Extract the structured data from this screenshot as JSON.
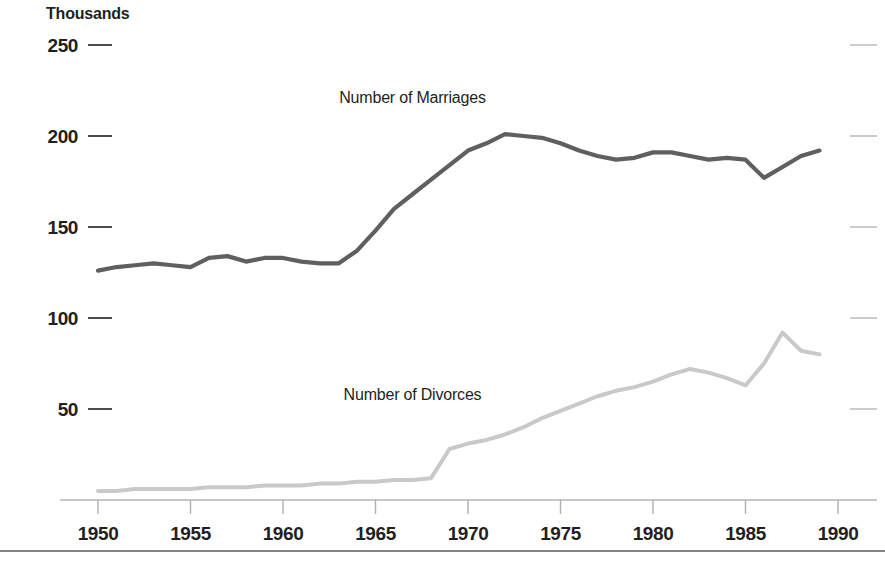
{
  "chart_data": {
    "type": "line",
    "title": "",
    "subtitle": "",
    "unit_label": "Thousands",
    "xlabel": "",
    "ylabel": "",
    "xlim": [
      1950,
      1990
    ],
    "ylim": [
      0,
      250
    ],
    "grid": false,
    "legend_position": "inline-annotation",
    "y_ticks": [
      50,
      100,
      150,
      200,
      250
    ],
    "y_tick_labels": [
      "50",
      "100",
      "150",
      "200",
      "250"
    ],
    "x_ticks": [
      1950,
      1955,
      1960,
      1965,
      1970,
      1975,
      1980,
      1985,
      1990
    ],
    "x_tick_labels": [
      "1950",
      "1955",
      "1960",
      "1965",
      "1970",
      "1975",
      "1980",
      "1985",
      "1990"
    ],
    "x": [
      1950,
      1951,
      1952,
      1953,
      1954,
      1955,
      1956,
      1957,
      1958,
      1959,
      1960,
      1961,
      1962,
      1963,
      1964,
      1965,
      1966,
      1967,
      1968,
      1969,
      1970,
      1971,
      1972,
      1973,
      1974,
      1975,
      1976,
      1977,
      1978,
      1979,
      1980,
      1981,
      1982,
      1983,
      1984,
      1985,
      1986,
      1987,
      1988,
      1989
    ],
    "series": [
      {
        "name": "Number of Marriages",
        "color": "#5f5f5f",
        "label_x": 1967,
        "label_y": 218,
        "values": [
          126,
          128,
          129,
          130,
          129,
          128,
          133,
          134,
          131,
          133,
          133,
          131,
          130,
          130,
          137,
          148,
          160,
          168,
          176,
          184,
          192,
          196,
          201,
          200,
          199,
          196,
          192,
          189,
          187,
          188,
          191,
          191,
          189,
          187,
          188,
          187,
          177,
          183,
          189,
          192
        ]
      },
      {
        "name": "Number of Divorces",
        "color": "#c9c9c9",
        "label_x": 1967,
        "label_y": 55,
        "values": [
          5,
          5,
          6,
          6,
          6,
          6,
          7,
          7,
          7,
          8,
          8,
          8,
          9,
          9,
          10,
          10,
          11,
          11,
          12,
          28,
          31,
          33,
          36,
          40,
          45,
          49,
          53,
          57,
          60,
          62,
          65,
          69,
          72,
          70,
          67,
          63,
          75,
          92,
          82,
          80
        ]
      }
    ],
    "annotations": [
      {
        "text": "Thousands",
        "x_px": 46,
        "y_px": 18
      }
    ]
  }
}
